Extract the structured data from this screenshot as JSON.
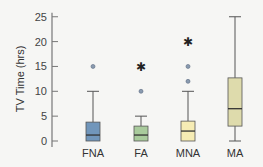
{
  "chart_data": {
    "type": "boxplot",
    "title": "",
    "xlabel": "",
    "ylabel": "TV Time (hrs)",
    "ylim": [
      0,
      25
    ],
    "yticks": [
      0,
      5,
      10,
      15,
      20,
      25
    ],
    "grid": false,
    "legend": null,
    "categories": [
      "FNA",
      "FA",
      "MNA",
      "MA"
    ],
    "series": [
      {
        "name": "FNA",
        "color": "#7196bb",
        "whisker_low": 0,
        "q1": 0,
        "median": 1.2,
        "q3": 3.8,
        "whisker_high": 10,
        "outliers": [
          {
            "value": 15,
            "marker": "circle"
          }
        ]
      },
      {
        "name": "FA",
        "color": "#a9cb9c",
        "whisker_low": 0,
        "q1": 0,
        "median": 1.2,
        "q3": 3,
        "whisker_high": 5,
        "outliers": [
          {
            "value": 10,
            "marker": "circle"
          },
          {
            "value": 15,
            "marker": "star"
          }
        ]
      },
      {
        "name": "MNA",
        "color": "#f6ecb4",
        "whisker_low": 0,
        "q1": 0,
        "median": 2,
        "q3": 4,
        "whisker_high": 10,
        "outliers": [
          {
            "value": 12,
            "marker": "circle"
          },
          {
            "value": 15,
            "marker": "circle"
          },
          {
            "value": 20,
            "marker": "star"
          }
        ]
      },
      {
        "name": "MA",
        "color": "#dedbac",
        "whisker_low": 0,
        "q1": 3,
        "median": 6.5,
        "q3": 12.7,
        "whisker_high": 25,
        "outliers": []
      }
    ]
  }
}
